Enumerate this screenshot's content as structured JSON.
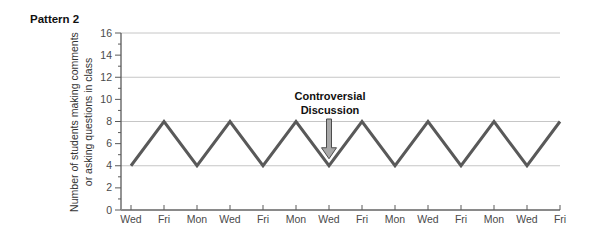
{
  "page_title": "Pattern 2",
  "chart_data": {
    "type": "line",
    "categories": [
      "Wed",
      "Fri",
      "Mon",
      "Wed",
      "Fri",
      "Mon",
      "Wed",
      "Fri",
      "Mon",
      "Wed",
      "Fri",
      "Mon",
      "Wed",
      "Fri"
    ],
    "values": [
      4,
      8,
      4,
      8,
      4,
      8,
      4,
      8,
      4,
      8,
      4,
      8,
      4,
      8
    ],
    "title": "Pattern 2",
    "xlabel": "",
    "ylabel_line1": "Number of students making comments",
    "ylabel_line2": "or asking questions in class",
    "ylim": [
      0,
      16
    ],
    "yticks_major": [
      0,
      2,
      4,
      6,
      8,
      10,
      12,
      14,
      16
    ],
    "yticks_minor": [
      1,
      3,
      5,
      7,
      9,
      11,
      13,
      15
    ],
    "gridlines_at": [
      4,
      8,
      12,
      16
    ],
    "grid": "horizontal",
    "legend": "none",
    "annotation": {
      "text_line1": "Controversial",
      "text_line2": "Discussion",
      "points_to_category_index": 6,
      "points_to_value": 4
    },
    "colors": {
      "line": "#595959",
      "grid": "#c6c6c6",
      "axis_y": "#5a5a5a",
      "axis_x": "#8a8a8a",
      "tick": "#5a5a5a",
      "tick_label": "#4a4a4a",
      "arrow_fill": "#a8a8a8",
      "arrow_stroke": "#4d4d4d"
    }
  }
}
